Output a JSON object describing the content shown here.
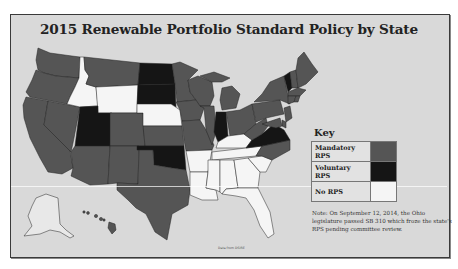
{
  "title": "2015 Renewable Portfolio Standard Policy by State",
  "key": {
    "title": "Key",
    "items": [
      {
        "label": "Mandatory RPS",
        "category": "mandatory",
        "color": "#555555"
      },
      {
        "label": "Voluntary RPS",
        "category": "voluntary",
        "color": "#151515"
      },
      {
        "label": "No RPS",
        "category": "none",
        "color": "#f5f5f5"
      }
    ]
  },
  "note": "Note: On September 12, 2014, the Ohio legislature passed SB 310 which froze the state's RPS pending committee review.",
  "source": "Data from DSIRE",
  "colors": {
    "mandatory": "#555555",
    "voluntary": "#151515",
    "none": "#f5f5f5",
    "background": "#d9d9d9",
    "alaska_fill": "#e8e8e8"
  },
  "states": {
    "WA": "mandatory",
    "OR": "mandatory",
    "CA": "mandatory",
    "NV": "mandatory",
    "ID": "none",
    "MT": "mandatory",
    "WY": "none",
    "UT": "voluntary",
    "AZ": "mandatory",
    "CO": "mandatory",
    "NM": "mandatory",
    "ND": "voluntary",
    "SD": "voluntary",
    "NE": "none",
    "KS": "mandatory",
    "OK": "voluntary",
    "TX": "mandatory",
    "MN": "mandatory",
    "IA": "mandatory",
    "MO": "mandatory",
    "AR": "none",
    "LA": "none",
    "WI": "mandatory",
    "IL": "mandatory",
    "MI": "mandatory",
    "IN": "voluntary",
    "OH": "mandatory",
    "KY": "none",
    "TN": "none",
    "MS": "none",
    "AL": "none",
    "GA": "none",
    "FL": "none",
    "SC": "none",
    "NC": "mandatory",
    "VA": "voluntary",
    "WV": "mandatory",
    "PA": "mandatory",
    "NY": "mandatory",
    "VT": "voluntary",
    "NH": "mandatory",
    "ME": "mandatory",
    "MA": "mandatory",
    "CT": "mandatory",
    "RI": "mandatory",
    "NJ": "mandatory",
    "DE": "mandatory",
    "MD": "mandatory",
    "HI": "mandatory",
    "AK": "none"
  }
}
